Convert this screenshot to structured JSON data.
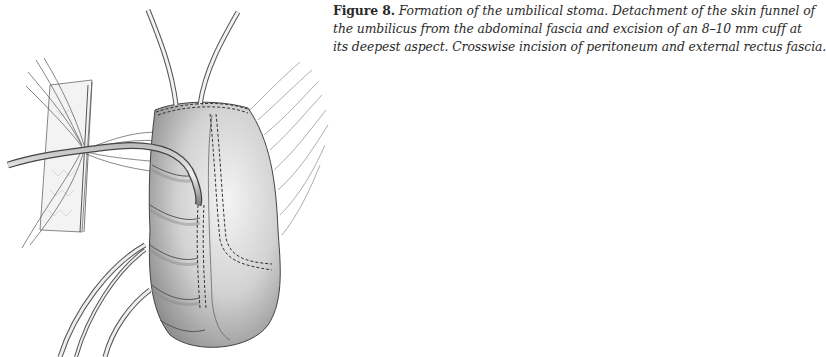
{
  "figure": {
    "label": "Figure 8.",
    "caption_lines": [
      " Formation of the umbilical stoma. Detachment of the skin funnel of",
      "the umbilicus from the abdominal fascia and excision of an 8–10 mm cuff at",
      "its deepest aspect. Crosswise incision of peritoneum and external rectus fascia."
    ],
    "illustration": {
      "subject": "surgical-illustration-umbilical-stoma",
      "colors": {
        "ink": "#3a3a3a",
        "shade": "#9a9a9a",
        "light": "#dcdcdc",
        "highlight": "#f2f2f2"
      }
    }
  }
}
